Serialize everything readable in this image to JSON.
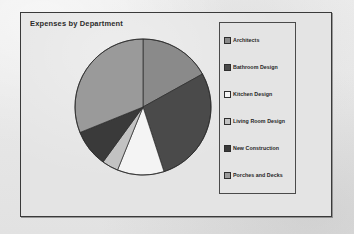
{
  "chart": {
    "title": "Expenses by Department",
    "frame_border_color": "#3a3a3a",
    "background_color": "#e4e4e4"
  },
  "legend": {
    "position": "right",
    "items": [
      {
        "label": "Architects",
        "color": "#8a8a8a"
      },
      {
        "label": "Bathroom Design",
        "color": "#4a4a4a"
      },
      {
        "label": "Kitchen Design",
        "color": "#f4f4f4"
      },
      {
        "label": "Living Room Design",
        "color": "#c2c2c2"
      },
      {
        "label": "New Construction",
        "color": "#3a3a3a"
      },
      {
        "label": "Porches and Decks",
        "color": "#9a9a9a"
      }
    ]
  },
  "chart_data": {
    "type": "pie",
    "title": "Expenses by Department",
    "xlabel": "",
    "ylabel": "",
    "legend_position": "right",
    "grid": false,
    "start_angle_deg": 0,
    "direction": "clockwise",
    "categories": [
      "Architects",
      "Bathroom Design",
      "Kitchen Design",
      "Living Room Design",
      "New Construction",
      "Porches and Decks"
    ],
    "values": [
      17,
      28,
      11,
      4,
      9,
      31
    ],
    "units": "percent",
    "colors": [
      "#8a8a8a",
      "#4a4a4a",
      "#f4f4f4",
      "#c2c2c2",
      "#3a3a3a",
      "#9a9a9a"
    ],
    "slices": [
      {
        "label": "Architects",
        "value": 17,
        "color": "#8a8a8a",
        "start_deg": 0,
        "end_deg": 61
      },
      {
        "label": "Bathroom Design",
        "value": 28,
        "color": "#4a4a4a",
        "start_deg": 61,
        "end_deg": 162
      },
      {
        "label": "Kitchen Design",
        "value": 11,
        "color": "#f4f4f4",
        "start_deg": 162,
        "end_deg": 202
      },
      {
        "label": "Living Room Design",
        "value": 4,
        "color": "#c2c2c2",
        "start_deg": 202,
        "end_deg": 216
      },
      {
        "label": "New Construction",
        "value": 9,
        "color": "#3a3a3a",
        "start_deg": 216,
        "end_deg": 248
      },
      {
        "label": "Porches and Decks",
        "value": 31,
        "color": "#9a9a9a",
        "start_deg": 248,
        "end_deg": 360
      }
    ]
  }
}
